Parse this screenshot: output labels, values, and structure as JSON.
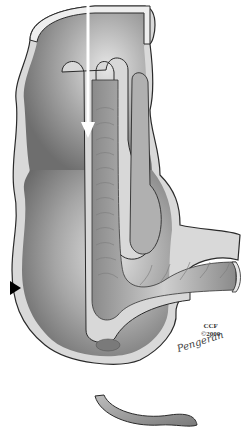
{
  "illustration": {
    "subject": "Ileocolic intussusception cross-section",
    "credit": {
      "line1": "CCF",
      "line2": "©2000",
      "signature": "Pengeran"
    },
    "markers": {
      "arrow": "white downward arrow",
      "pointer": "black triangle pointer"
    },
    "colors": {
      "wall_outline": "#2a2a2a",
      "wall_fill": "#d9d9d9",
      "lumen": "#9a9a9a",
      "lumen_highlight": "#d0d0d0",
      "arrow": "#ffffff",
      "pointer": "#000000"
    }
  }
}
